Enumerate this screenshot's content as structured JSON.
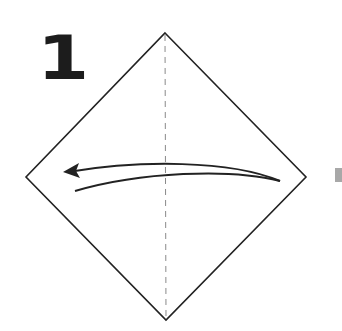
{
  "diagram": {
    "type": "origami-instruction-step",
    "step_number": "1",
    "paper": {
      "shape": "diamond",
      "vertices": {
        "top": [
          165,
          33
        ],
        "right": [
          306,
          177
        ],
        "bottom": [
          166,
          320
        ],
        "left": [
          26,
          177
        ]
      },
      "stroke_color": "#222222"
    },
    "fold_line": {
      "style": "dashed",
      "kind": "valley-fold",
      "from": [
        165,
        33
      ],
      "to": [
        166,
        320
      ],
      "color": "#8a8a8a"
    },
    "fold_arrow": {
      "direction": "right-to-left",
      "start": [
        280,
        181
      ],
      "end": [
        65,
        172
      ],
      "color": "#222222"
    },
    "colors": {
      "background": "#ffffff",
      "line": "#222222",
      "dash": "#8a8a8a",
      "side_mark": "#a8a8a8"
    }
  }
}
